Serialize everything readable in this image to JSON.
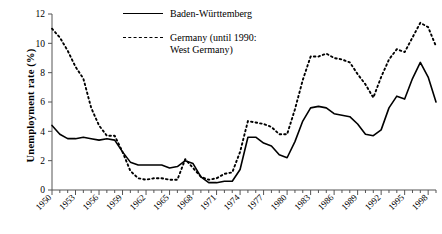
{
  "chart_data": {
    "type": "line",
    "title": "",
    "xlabel": "",
    "ylabel": "Unemployment rate (%)",
    "ylim": [
      0,
      12
    ],
    "yticks": [
      0,
      2,
      4,
      6,
      8,
      10,
      12
    ],
    "xlim": [
      1950,
      1999
    ],
    "xticks": [
      1950,
      1953,
      1956,
      1959,
      1962,
      1965,
      1968,
      1971,
      1974,
      1977,
      1980,
      1983,
      1986,
      1989,
      1992,
      1995,
      1998
    ],
    "xtick_labels": [
      "1950",
      "1953",
      "1956",
      "1959",
      "1962",
      "1965",
      "1968",
      "1971",
      "1974",
      "1977",
      "1980",
      "1983",
      "1986",
      "1989",
      "1992",
      "1995",
      "1998"
    ],
    "ytick_labels": [
      "0",
      "2",
      "4",
      "6",
      "8",
      "10",
      "12"
    ],
    "grid": false,
    "legend_position": "top-center",
    "x": [
      1950,
      1951,
      1952,
      1953,
      1954,
      1955,
      1956,
      1957,
      1958,
      1959,
      1960,
      1961,
      1962,
      1963,
      1964,
      1965,
      1966,
      1967,
      1968,
      1969,
      1970,
      1971,
      1972,
      1973,
      1974,
      1975,
      1976,
      1977,
      1978,
      1979,
      1980,
      1981,
      1982,
      1983,
      1984,
      1985,
      1986,
      1987,
      1988,
      1989,
      1990,
      1991,
      1992,
      1993,
      1994,
      1995,
      1996,
      1997,
      1998,
      1999
    ],
    "series": [
      {
        "name": "Baden-Württemberg",
        "style": "solid",
        "color": "#000000",
        "values": [
          4.4,
          3.8,
          3.5,
          3.5,
          3.6,
          3.5,
          3.4,
          3.5,
          3.4,
          2.6,
          1.9,
          1.7,
          1.7,
          1.7,
          1.7,
          1.5,
          1.6,
          2.0,
          1.8,
          0.9,
          0.5,
          0.5,
          0.6,
          0.6,
          1.4,
          3.6,
          3.6,
          3.2,
          3.0,
          2.4,
          2.2,
          3.3,
          4.7,
          5.6,
          5.7,
          5.6,
          5.2,
          5.1,
          5.0,
          4.5,
          3.8,
          3.7,
          4.1,
          5.6,
          6.4,
          6.2,
          7.6,
          8.7,
          7.7,
          6.0
        ]
      },
      {
        "name": "Germany (until 1990: West Germany)",
        "style": "dashed",
        "color": "#000000",
        "values": [
          11.0,
          10.4,
          9.5,
          8.4,
          7.6,
          5.6,
          4.4,
          3.7,
          3.7,
          2.6,
          1.3,
          0.8,
          0.7,
          0.8,
          0.8,
          0.7,
          0.7,
          2.1,
          1.5,
          0.9,
          0.7,
          0.8,
          1.1,
          1.2,
          2.6,
          4.7,
          4.6,
          4.5,
          4.3,
          3.8,
          3.8,
          5.5,
          7.5,
          9.1,
          9.1,
          9.3,
          9.0,
          8.9,
          8.7,
          7.9,
          7.2,
          6.3,
          7.7,
          8.9,
          9.6,
          9.4,
          10.4,
          11.4,
          11.1,
          9.8
        ]
      }
    ],
    "legend": [
      {
        "label": "Baden-Württemberg",
        "style": "solid"
      },
      {
        "label": "Germany (until 1990:",
        "label2": "West Germany)",
        "style": "dashed"
      }
    ]
  },
  "legend": {
    "item1_label": "Baden-Württemberg",
    "item2_label_line1": "Germany (until 1990:",
    "item2_label_line2": "West Germany)"
  },
  "axes": {
    "y_title": "Unemployment rate (%)"
  }
}
